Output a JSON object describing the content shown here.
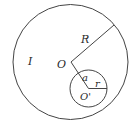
{
  "diagram": {
    "labels": {
      "current": "I",
      "big_radius": "R",
      "big_center": "O",
      "offset": "a",
      "small_radius": "r",
      "small_center": "O'"
    },
    "colors": {
      "stroke": "#444444",
      "text": "#2a2a2a",
      "background": "#ffffff"
    }
  }
}
